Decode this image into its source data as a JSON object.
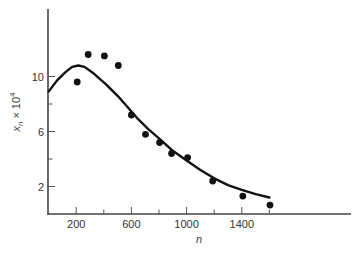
{
  "chart_data": {
    "type": "scatter",
    "title": "",
    "xlabel": "n",
    "ylabel": "x_n × 10^4",
    "ylabel_parts": {
      "base": "x",
      "sub": "n",
      "times": "×",
      "power_base": "10",
      "power_exp": "4"
    },
    "xlim": [
      0,
      2200
    ],
    "ylim": [
      0,
      15
    ],
    "x_ticks_major": [
      200,
      600,
      1000,
      1400
    ],
    "x_ticks_minor": [
      400,
      800,
      1200,
      1600
    ],
    "x_tick_labels": [
      "200",
      "600",
      "1000",
      "1400"
    ],
    "y_ticks_major": [
      2,
      6,
      10
    ],
    "y_ticks_minor": [
      4,
      8
    ],
    "y_tick_labels": [
      "2",
      "6",
      "10"
    ],
    "grid": false,
    "legend": null,
    "series": [
      {
        "name": "observed",
        "kind": "points",
        "color": "#111111",
        "x": [
          207,
          287,
          404,
          505,
          600,
          702,
          804,
          891,
          1007,
          1189,
          1407,
          1604
        ],
        "y": [
          9.6,
          11.6,
          11.5,
          10.8,
          7.2,
          5.8,
          5.2,
          4.4,
          4.1,
          2.4,
          1.3,
          0.65
        ]
      },
      {
        "name": "model",
        "kind": "line",
        "color": "#111111",
        "x": [
          0,
          60,
          120,
          170,
          215,
          260,
          330,
          420,
          500,
          570,
          640,
          720,
          800,
          900,
          1000,
          1100,
          1200,
          1300,
          1400,
          1500,
          1600
        ],
        "y": [
          8.9,
          9.7,
          10.3,
          10.7,
          10.8,
          10.7,
          10.2,
          9.4,
          8.6,
          7.8,
          7.0,
          6.2,
          5.5,
          4.6,
          3.9,
          3.2,
          2.6,
          2.1,
          1.75,
          1.45,
          1.2
        ]
      }
    ]
  }
}
